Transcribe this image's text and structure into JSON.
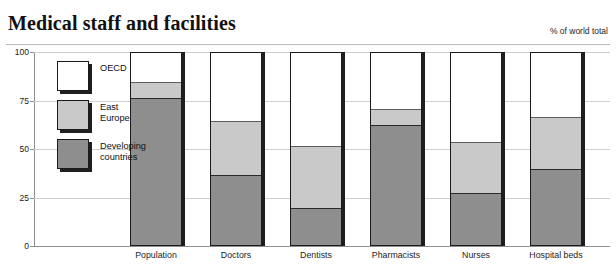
{
  "header": {
    "title": "Medical staff and facilities",
    "units": "% of world total"
  },
  "legend": {
    "items": [
      {
        "label": "OECD",
        "color": "#ffffff",
        "swatch": "w"
      },
      {
        "label": "East\nEurope",
        "color": "#c9c9c9",
        "swatch": "g"
      },
      {
        "label": "Developing\ncountries",
        "color": "#8e8e8e",
        "swatch": "d"
      }
    ]
  },
  "axes": {
    "yticks": [
      "100",
      "75",
      "50",
      "25",
      "0"
    ],
    "ymin": 0,
    "ymax": 100
  },
  "chart_data": {
    "type": "bar",
    "title": "Medical staff and facilities",
    "subtitle": "% of world total",
    "xlabel": "",
    "ylabel": "% of world total",
    "ylim": [
      0,
      100
    ],
    "yticks": [
      0,
      25,
      50,
      75,
      100
    ],
    "grid": true,
    "stacked": true,
    "legend_position": "inside-left",
    "categories": [
      "Population",
      "Doctors",
      "Dentists",
      "Pharmacists",
      "Nurses",
      "Hospital beds"
    ],
    "series": [
      {
        "name": "Developing countries",
        "color": "#8e8e8e",
        "values": [
          76,
          36,
          19,
          62,
          27,
          39
        ]
      },
      {
        "name": "East Europe",
        "color": "#c9c9c9",
        "values": [
          8,
          28,
          32,
          8,
          26,
          27
        ]
      },
      {
        "name": "OECD",
        "color": "#ffffff",
        "values": [
          16,
          36,
          49,
          30,
          47,
          34
        ]
      }
    ],
    "cumulative_tops": {
      "Population": {
        "developing": 76,
        "east_europe": 84,
        "oecd": 100
      },
      "Doctors": {
        "developing": 36,
        "east_europe": 64,
        "oecd": 100
      },
      "Dentists": {
        "developing": 19,
        "east_europe": 51,
        "oecd": 100
      },
      "Pharmacists": {
        "developing": 62,
        "east_europe": 70,
        "oecd": 100
      },
      "Nurses": {
        "developing": 27,
        "east_europe": 53,
        "oecd": 100
      },
      "Hospital beds": {
        "developing": 39,
        "east_europe": 66,
        "oecd": 100
      }
    }
  }
}
